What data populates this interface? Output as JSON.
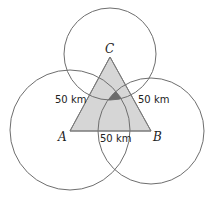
{
  "diagram": {
    "type": "geometry",
    "colors": {
      "background": "#ffffff",
      "circle_stroke": "#6e6e6e",
      "triangle_fill": "#d6d6d6",
      "triangle_stroke": "#7a7a7a",
      "intersection_fill": "#6b6b6b"
    },
    "vertices": [
      {
        "label": "A",
        "x": 70,
        "y": 131
      },
      {
        "label": "B",
        "x": 151,
        "y": 131
      },
      {
        "label": "C",
        "x": 110,
        "y": 57
      }
    ],
    "circles": [
      {
        "center": "A",
        "cx": 70,
        "cy": 130,
        "r": 60
      },
      {
        "center": "B",
        "cx": 151,
        "cy": 131,
        "r": 53
      },
      {
        "center": "C",
        "cx": 110,
        "cy": 54,
        "r": 46
      }
    ],
    "labels": {
      "left_radius": "50 km",
      "right_radius": "50 km",
      "bottom_radius": "50 km",
      "vertex_a": "A",
      "vertex_b": "B",
      "vertex_c": "C"
    }
  }
}
